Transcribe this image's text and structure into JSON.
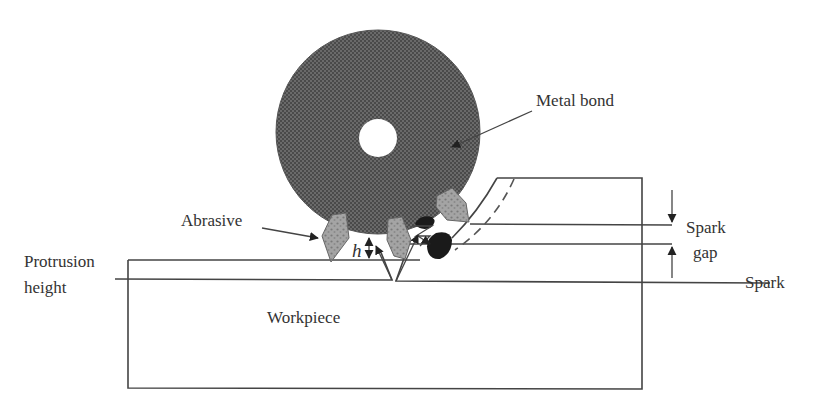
{
  "diagram": {
    "labels": {
      "metal_bond": "Metal bond",
      "abrasive": "Abrasive",
      "protrusion_line1": "Protrusion",
      "protrusion_line2": "height",
      "h_symbol": "h",
      "spark_gap_line1": "Spark",
      "spark_gap_line2": "gap",
      "spark": "Spark",
      "workpiece": "Workpiece"
    },
    "colors": {
      "wheel_fill": "#5a5a5a",
      "abrasive_fill": "#9a9a9a",
      "spark_fill": "#1a1a1a",
      "line": "#444444",
      "text": "#333333",
      "background": "#ffffff"
    },
    "geometry": {
      "wheel": {
        "cx": 378,
        "cy": 132,
        "r": 102
      },
      "hole": {
        "cx": 378,
        "cy": 138,
        "r": 19
      },
      "workpiece_box": {
        "x": 128,
        "y": 260,
        "w": 514,
        "h": 129
      }
    }
  }
}
